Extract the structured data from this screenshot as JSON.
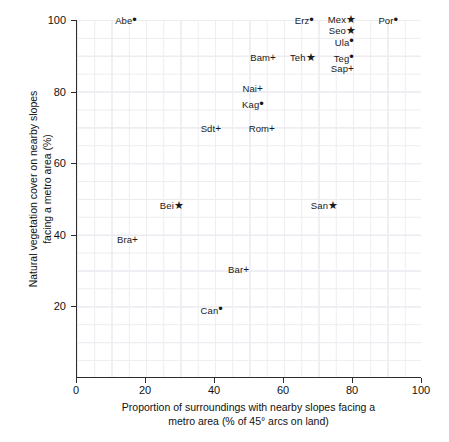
{
  "chart_data": {
    "type": "scatter",
    "title": "",
    "xlabel": "Proportion of surroundings with nearby slopes facing a\nmetro area (% of 45° arcs on land)",
    "xlabel_line1": "Proportion of surroundings with nearby slopes facing a",
    "xlabel_line2": "metro area (% of 45° arcs on land)",
    "ylabel": "Natural vegetation cover on nearby slopes\nfacing a metro area (%)",
    "ylabel_line1": "Natural vegetation cover on nearby slopes",
    "ylabel_line2": "facing a metro area (%)",
    "xlim": [
      0,
      103
    ],
    "ylim": [
      0,
      103
    ],
    "xticks": [
      0,
      20,
      40,
      60,
      80,
      100
    ],
    "yticks": [
      20,
      40,
      60,
      80,
      100
    ],
    "grid": true,
    "grid_minor_step": 5,
    "grid_major_step": 10,
    "legend": "none",
    "marker_kinds": [
      "dot",
      "star",
      "plus"
    ],
    "points": [
      {
        "label": "Abe",
        "marker": "dot",
        "x": 16.5,
        "y": 100
      },
      {
        "label": "Erz",
        "marker": "dot",
        "x": 67.8,
        "y": 100
      },
      {
        "label": "Mex",
        "marker": "star",
        "x": 80.0,
        "y": 100
      },
      {
        "label": "Por",
        "marker": "dot",
        "x": 92.2,
        "y": 100
      },
      {
        "label": "Seo",
        "marker": "star",
        "x": 80.0,
        "y": 96.9
      },
      {
        "label": "Ula",
        "marker": "dot",
        "x": 79.4,
        "y": 93.9
      },
      {
        "label": "Bam",
        "marker": "plus",
        "x": 56.8,
        "y": 89.4
      },
      {
        "label": "Teh",
        "marker": "star",
        "x": 68.3,
        "y": 89.4
      },
      {
        "label": "Teg",
        "marker": "dot",
        "x": 79.4,
        "y": 89.4
      },
      {
        "label": "Sap",
        "marker": "plus",
        "x": 79.4,
        "y": 86.3
      },
      {
        "label": "Nai",
        "marker": "plus",
        "x": 53.0,
        "y": 80.7
      },
      {
        "label": "Kag",
        "marker": "dot",
        "x": 53.3,
        "y": 76.5
      },
      {
        "label": "Sdt",
        "marker": "plus",
        "x": 40.9,
        "y": 69.6
      },
      {
        "label": "Rom",
        "marker": "plus",
        "x": 56.5,
        "y": 69.6
      },
      {
        "label": "Bei",
        "marker": "star",
        "x": 30.1,
        "y": 48.0
      },
      {
        "label": "San",
        "marker": "star",
        "x": 74.8,
        "y": 48.0
      },
      {
        "label": "Bra",
        "marker": "plus",
        "x": 16.8,
        "y": 38.5
      },
      {
        "label": "Bar",
        "marker": "plus",
        "x": 49.0,
        "y": 30.2
      },
      {
        "label": "Can",
        "marker": "dot",
        "x": 41.4,
        "y": 19.0
      }
    ]
  }
}
